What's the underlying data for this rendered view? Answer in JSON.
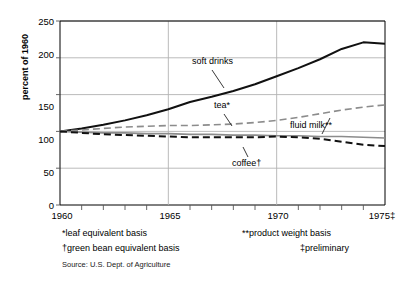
{
  "axes": {
    "ylabel": "percent of 1960",
    "yticks": [
      0,
      50,
      100,
      150,
      200,
      250
    ],
    "ytick_labels": [
      "0",
      "50",
      "100",
      "150",
      "200",
      "250"
    ],
    "xtick_labels": [
      "1960",
      "1965",
      "1970",
      "1975‡"
    ],
    "xtick_years": [
      1960,
      1965,
      1970,
      1975
    ],
    "xlim": [
      1960,
      1975
    ],
    "ylim": [
      0,
      250
    ]
  },
  "annotations": {
    "soft_drinks": "soft drinks",
    "tea": "tea*",
    "fluid_milk": "fluid milk**",
    "coffee": "coffee†"
  },
  "footnotes": {
    "leaf": "*leaf equivalent basis",
    "green_bean": "†green bean equivalent basis",
    "product_weight": "**product weight basis",
    "preliminary": "‡preliminary",
    "source": "Source: U.S. Dept. of Agriculture"
  },
  "colors": {
    "soft_drinks": "#111111",
    "tea": "#8c8c8c",
    "fluid_milk": "#8c8c8c",
    "coffee": "#111111",
    "grid": "#b3b3b3",
    "axis": "#555555",
    "frame": "#000000"
  },
  "chart_data": {
    "type": "line",
    "title": "",
    "xlabel": "",
    "ylabel": "percent of 1960",
    "xlim": [
      1960,
      1975
    ],
    "ylim": [
      0,
      250
    ],
    "grid": true,
    "legend": "annotated-inline",
    "x": [
      1960,
      1961,
      1962,
      1963,
      1964,
      1965,
      1966,
      1967,
      1968,
      1969,
      1970,
      1971,
      1972,
      1973,
      1974,
      1975
    ],
    "series": [
      {
        "name": "soft drinks",
        "style": "solid",
        "color": "#111111",
        "footnote": "",
        "values": [
          100,
          104,
          109,
          115,
          122,
          130,
          140,
          147,
          155,
          164,
          175,
          186,
          198,
          212,
          221,
          219
        ]
      },
      {
        "name": "tea*",
        "style": "solid",
        "color": "#8c8c8c",
        "footnote": "*leaf equivalent basis",
        "values": [
          100,
          99,
          98,
          98,
          97,
          97,
          96,
          96,
          95,
          95,
          94,
          94,
          93,
          93,
          92,
          91
        ]
      },
      {
        "name": "fluid milk**",
        "style": "dashed",
        "color": "#8c8c8c",
        "footnote": "**product weight basis",
        "values": [
          100,
          102,
          104,
          106,
          107,
          108,
          108,
          109,
          110,
          112,
          115,
          119,
          124,
          129,
          133,
          136
        ]
      },
      {
        "name": "coffee†",
        "style": "dashed",
        "color": "#111111",
        "footnote": "†green bean equivalent basis",
        "values": [
          100,
          98,
          96,
          95,
          94,
          93,
          92,
          92,
          92,
          92,
          93,
          92,
          90,
          86,
          82,
          80
        ]
      }
    ]
  }
}
